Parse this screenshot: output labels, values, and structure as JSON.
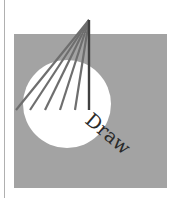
{
  "illustration": {
    "label": "Draw",
    "colors": {
      "background": "#ffffff",
      "square": "#a3a3a3",
      "circle": "#ffffff",
      "lines": "#6e6e6e",
      "main_line": "#404040",
      "text": "#2a2a2a",
      "rule": "#b0b0b0"
    }
  }
}
